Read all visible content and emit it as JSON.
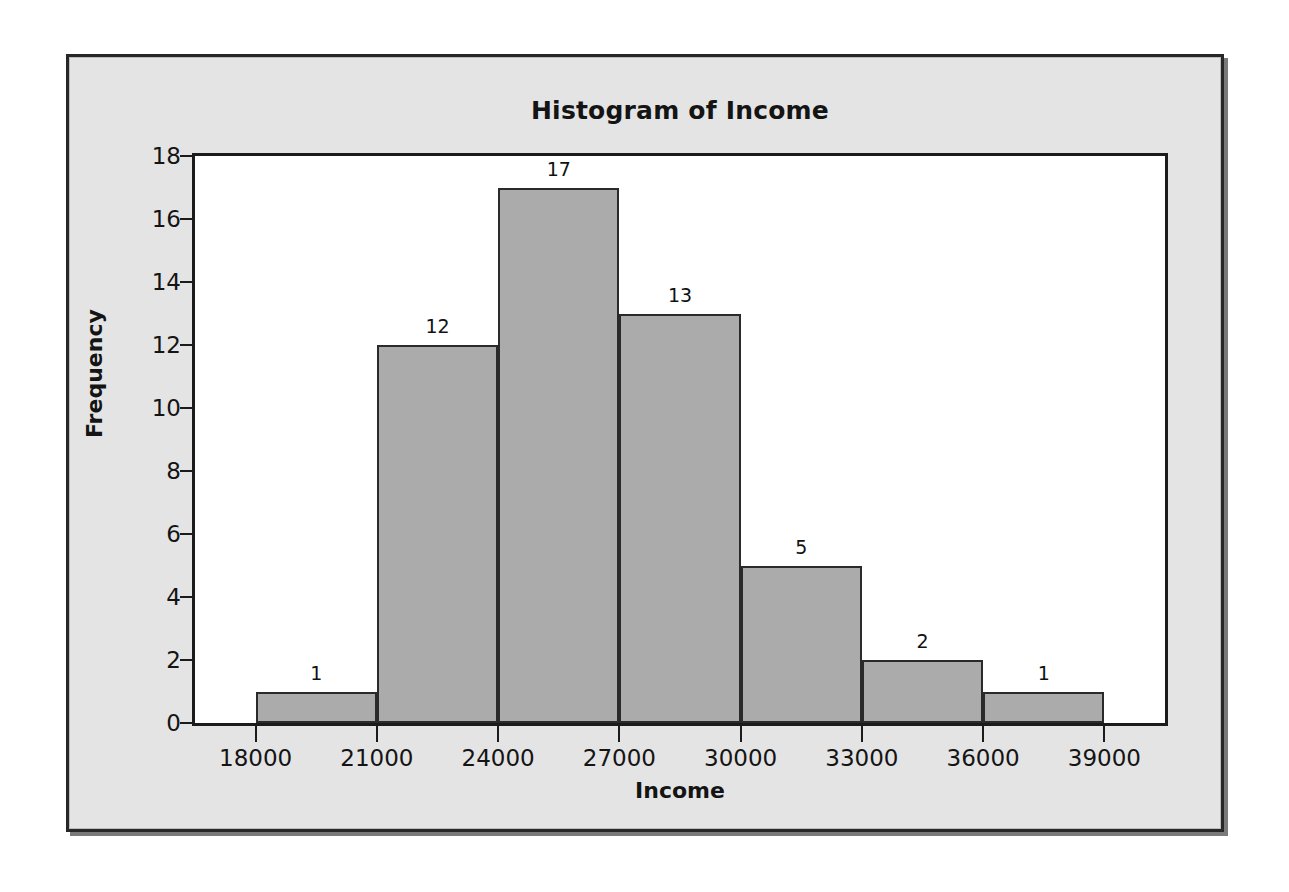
{
  "chart_data": {
    "type": "bar",
    "title": "Histogram of Income",
    "xlabel": "Income",
    "ylabel": "Frequency",
    "bin_width": 3000,
    "bin_edges": [
      18000,
      21000,
      24000,
      27000,
      30000,
      33000,
      36000,
      39000
    ],
    "categories": [
      "18000-21000",
      "21000-24000",
      "24000-27000",
      "27000-30000",
      "30000-33000",
      "33000-36000",
      "36000-39000"
    ],
    "values": [
      1,
      12,
      17,
      13,
      5,
      2,
      1
    ],
    "data_labels": [
      "1",
      "12",
      "17",
      "13",
      "5",
      "2",
      "1"
    ],
    "xlim": [
      16500,
      40500
    ],
    "ylim": [
      0,
      18
    ],
    "x_ticks": [
      18000,
      21000,
      24000,
      27000,
      30000,
      33000,
      36000,
      39000
    ],
    "x_tick_labels": [
      "18000",
      "21000",
      "24000",
      "27000",
      "30000",
      "33000",
      "36000",
      "39000"
    ],
    "y_ticks": [
      0,
      2,
      4,
      6,
      8,
      10,
      12,
      14,
      16,
      18
    ],
    "y_tick_labels": [
      "0",
      "2",
      "4",
      "6",
      "8",
      "10",
      "12",
      "14",
      "16",
      "18"
    ],
    "grid": false,
    "legend": false,
    "bar_fill_color": "#ababab",
    "bar_border_color": "#2a2a2a",
    "plot_background": "#ffffff",
    "panel_background": "#e4e4e4",
    "axis_color": "#1b1b1b",
    "text_color": "#141414",
    "total_frequency": 51
  }
}
